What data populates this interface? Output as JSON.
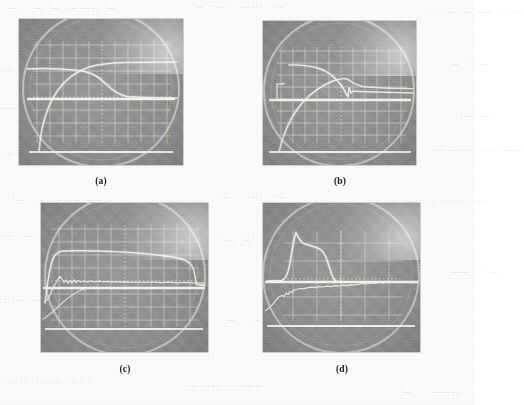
{
  "figure": {
    "kind": "scanned-photographic-figure",
    "panel_count": 4,
    "paper_color": "#fbfbfa",
    "photo_background_color": "#8d8d8d",
    "trace_color": "#f2f2ee",
    "graticule_color": "#d8d8d2"
  },
  "captions": [
    {
      "id": "a",
      "label": "(a)"
    },
    {
      "id": "b",
      "label": "(b)"
    },
    {
      "id": "c",
      "label": "(c)"
    },
    {
      "id": "d",
      "label": "(d)"
    }
  ],
  "ghost_text": [
    {
      "text": "· — ·· —   ·—· —  ——  ·—",
      "x": 2,
      "y": 4,
      "size": 7
    },
    {
      "text": "—  ··—· ·  ——·· ·—",
      "x": 196,
      "y": 3,
      "size": 7
    },
    {
      "text": "··· —  ·—  —— ·· —·",
      "x": 430,
      "y": 8,
      "size": 7
    },
    {
      "text": "·— ·—·· ·",
      "x": 0,
      "y": 66,
      "size": 7
    },
    {
      "text": "— ·· ·—",
      "x": 452,
      "y": 60,
      "size": 7
    },
    {
      "text": "—— ·· · —·—",
      "x": 0,
      "y": 104,
      "size": 7
    },
    {
      "text": "··— ·—",
      "x": 456,
      "y": 112,
      "size": 7
    },
    {
      "text": "·—· ·· ——— ·—·· ·",
      "x": 2,
      "y": 150,
      "size": 7
    },
    {
      "text": "·—  ——— ·—·· ——",
      "x": 432,
      "y": 146,
      "size": 7
    },
    {
      "text": "··—· ·—· ——— —— ·",
      "x": 8,
      "y": 196,
      "size": 7
    },
    {
      "text": "— ·· ·—·· ·—",
      "x": 222,
      "y": 193,
      "size": 7
    },
    {
      "text": "·—·· ·· ——— ·—·",
      "x": 402,
      "y": 197,
      "size": 7
    },
    {
      "text": "·—· ·—",
      "x": 0,
      "y": 232,
      "size": 7
    },
    {
      "text": "·— ·—·· ——— ··—",
      "x": 222,
      "y": 236,
      "size": 7
    },
    {
      "text": "—— ·· ·—",
      "x": 452,
      "y": 268,
      "size": 7
    },
    {
      "text": "·· ·—· ———",
      "x": 0,
      "y": 296,
      "size": 7
    },
    {
      "text": "—·· ·—·· ——",
      "x": 228,
      "y": 316,
      "size": 7
    },
    {
      "text": "·—·· ·· —— ·—· ·",
      "x": 6,
      "y": 378,
      "size": 7
    },
    {
      "text": "·— —— ·· ———",
      "x": 186,
      "y": 382,
      "size": 7
    },
    {
      "text": "·—· ·· ———",
      "x": 400,
      "y": 388,
      "size": 7
    }
  ],
  "chart_data": [
    {
      "id": "a",
      "type": "line",
      "title": "(a)",
      "display": "oscilloscope CRT photograph",
      "graticule": {
        "columns": 10,
        "rows": 8,
        "on": true,
        "center_ticks": true
      },
      "axis_note": "horizontal axis is time, vertical axis is signal amplitude; no numeric tick labels are printed on the photograph",
      "traces": [
        {
          "name": "upper-decaying-trace",
          "note": "nearly flat plateau in the left half that rolls off and drops steeply just right of screen centre",
          "x": [
            0.0,
            0.06,
            0.12,
            0.18,
            0.24,
            0.3,
            0.36,
            0.42,
            0.46,
            0.5,
            0.54,
            0.58,
            0.62,
            0.66,
            0.7,
            0.76,
            0.84,
            0.92,
            1.0
          ],
          "y": [
            0.66,
            0.665,
            0.665,
            0.66,
            0.655,
            0.645,
            0.63,
            0.61,
            0.59,
            0.565,
            0.53,
            0.49,
            0.44,
            0.4,
            0.385,
            0.38,
            0.378,
            0.377,
            0.376
          ]
        },
        {
          "name": "rising-s-curve-trace",
          "note": "starts at the bottom baseline on the left, rises with an exponential S shape and merges with the falling trace near screen centre",
          "x": [
            0.0,
            0.05,
            0.1,
            0.14,
            0.18,
            0.22,
            0.26,
            0.3,
            0.34,
            0.38,
            0.42,
            0.46,
            0.5,
            0.54,
            0.6,
            0.7,
            0.85,
            1.0
          ],
          "y": [
            0.085,
            0.087,
            0.092,
            0.105,
            0.13,
            0.165,
            0.215,
            0.275,
            0.34,
            0.41,
            0.475,
            0.53,
            0.565,
            0.58,
            0.583,
            0.583,
            0.582,
            0.582
          ]
        },
        {
          "name": "mid-baseline-trace",
          "note": "bright horizontal reference line crossing the full width at about 45 percent screen height",
          "x": [
            0.0,
            1.0
          ],
          "y": [
            0.455,
            0.455
          ]
        },
        {
          "name": "lower-baseline-trace",
          "note": "bright horizontal reference line near the bottom of the graticule",
          "x": [
            0.0,
            1.0
          ],
          "y": [
            0.085,
            0.085
          ]
        }
      ]
    },
    {
      "id": "b",
      "type": "line",
      "title": "(b)",
      "display": "oscilloscope CRT photograph",
      "graticule": {
        "columns": 10,
        "rows": 8,
        "on": true,
        "center_ticks": true
      },
      "axis_note": "horizontal axis is time, vertical axis is signal amplitude; no numeric tick labels are printed on the photograph",
      "traces": [
        {
          "name": "upper-decaying-trace",
          "note": "flat-topped trace beginning about one fifth from the left, sloping gently down and then falling sharply at screen centre into a small overshoot spike",
          "x": [
            0.17,
            0.22,
            0.28,
            0.34,
            0.4,
            0.45,
            0.5,
            0.54,
            0.57,
            0.6,
            0.62,
            0.64,
            0.67,
            0.72,
            0.8,
            0.9,
            1.0
          ],
          "y": [
            0.695,
            0.69,
            0.675,
            0.655,
            0.63,
            0.6,
            0.555,
            0.5,
            0.455,
            0.42,
            0.46,
            0.435,
            0.425,
            0.42,
            0.415,
            0.41,
            0.405
          ]
        },
        {
          "name": "rising-s-curve-trace",
          "note": "climbs from the lower baseline on the left through a steep exponential knee and meets the falling trace at screen centre",
          "x": [
            0.1,
            0.16,
            0.22,
            0.27,
            0.32,
            0.36,
            0.4,
            0.44,
            0.48,
            0.52,
            0.55,
            0.58,
            0.62,
            0.7,
            0.85,
            1.0
          ],
          "y": [
            0.085,
            0.09,
            0.1,
            0.125,
            0.165,
            0.215,
            0.275,
            0.345,
            0.42,
            0.48,
            0.5,
            0.49,
            0.475,
            0.47,
            0.465,
            0.46
          ]
        },
        {
          "name": "mid-baseline-trace",
          "note": "bright horizontal reference line across the full width at about 45 percent screen height",
          "x": [
            0.0,
            1.0
          ],
          "y": [
            0.45,
            0.45
          ]
        },
        {
          "name": "lower-baseline-trace",
          "note": "bright horizontal reference line near the bottom of the graticule",
          "x": [
            0.0,
            1.0
          ],
          "y": [
            0.085,
            0.085
          ]
        },
        {
          "name": "left-step-trace",
          "note": "short vertical step at the far left joining the mid baseline to a brief flat segment above it",
          "x": [
            0.02,
            0.06,
            0.08,
            0.08,
            0.12
          ],
          "y": [
            0.45,
            0.45,
            0.45,
            0.56,
            0.56
          ]
        }
      ]
    },
    {
      "id": "c",
      "type": "line",
      "title": "(c)",
      "display": "oscilloscope CRT photograph",
      "graticule": {
        "columns": 10,
        "rows": 8,
        "on": true,
        "center_ticks": true
      },
      "axis_note": "horizontal axis is time, vertical axis is signal amplitude; no numeric tick labels are printed on the photograph",
      "traces": [
        {
          "name": "upper-plateau-trace",
          "note": "rises very steeply at the left edge to a long flat plateau that sags slowly across the screen and then drops sharply near the right edge",
          "x": [
            0.02,
            0.04,
            0.06,
            0.08,
            0.12,
            0.2,
            0.3,
            0.4,
            0.5,
            0.58,
            0.66,
            0.74,
            0.8,
            0.85,
            0.88,
            0.9,
            0.92,
            0.96,
            1.0
          ],
          "y": [
            0.33,
            0.44,
            0.56,
            0.655,
            0.675,
            0.672,
            0.665,
            0.655,
            0.645,
            0.635,
            0.62,
            0.6,
            0.585,
            0.565,
            0.54,
            0.49,
            0.44,
            0.43,
            0.428
          ]
        },
        {
          "name": "noisy-middle-trace",
          "note": "noisy ripple riding just above the mid reference line, with a pronounced dip and recovery in the left third",
          "x": [
            0.02,
            0.06,
            0.1,
            0.13,
            0.16,
            0.19,
            0.22,
            0.25,
            0.28,
            0.32,
            0.38,
            0.45,
            0.52,
            0.6,
            0.68,
            0.76,
            0.84,
            0.9,
            0.95,
            1.0
          ],
          "y": [
            0.34,
            0.355,
            0.4,
            0.43,
            0.4,
            0.435,
            0.415,
            0.445,
            0.455,
            0.46,
            0.465,
            0.468,
            0.47,
            0.468,
            0.465,
            0.462,
            0.458,
            0.452,
            0.45,
            0.448
          ]
        },
        {
          "name": "mid-baseline-trace",
          "note": "bright horizontal reference line across the full width at roughly 43 percent screen height",
          "x": [
            0.0,
            1.0
          ],
          "y": [
            0.432,
            0.432
          ]
        },
        {
          "name": "lower-rising-trace",
          "note": "faint ramp rising from the bottom left of the graticule up toward the noisy middle trace",
          "x": [
            0.0,
            0.04,
            0.08,
            0.12,
            0.16,
            0.2,
            0.24,
            0.28,
            0.32
          ],
          "y": [
            0.145,
            0.17,
            0.215,
            0.275,
            0.315,
            0.355,
            0.385,
            0.41,
            0.43
          ]
        },
        {
          "name": "lower-baseline-trace",
          "note": "bright horizontal reference line near the bottom of the graticule",
          "x": [
            0.0,
            1.0
          ],
          "y": [
            0.155,
            0.155
          ]
        }
      ]
    },
    {
      "id": "d",
      "type": "line",
      "title": "(d)",
      "display": "oscilloscope CRT photograph",
      "graticule": {
        "columns": 10,
        "rows": 8,
        "on": true,
        "center_ticks": true
      },
      "axis_note": "horizontal axis is time, vertical axis is signal amplitude; no numeric tick labels are printed on the photograph",
      "traces": [
        {
          "name": "pulse-trace",
          "note": "narrow pulse in the left third: near-vertical leading edge to a sharp peak, a slightly drooping top, then a steep fall back to the baseline before screen centre",
          "x": [
            0.02,
            0.08,
            0.13,
            0.17,
            0.19,
            0.2,
            0.22,
            0.25,
            0.29,
            0.33,
            0.37,
            0.4,
            0.42,
            0.44,
            0.45,
            0.46,
            0.48,
            0.52,
            0.6,
            0.8,
            1.0
          ],
          "y": [
            0.475,
            0.478,
            0.5,
            0.6,
            0.72,
            0.8,
            0.775,
            0.755,
            0.74,
            0.725,
            0.7,
            0.665,
            0.61,
            0.545,
            0.51,
            0.49,
            0.482,
            0.48,
            0.478,
            0.477,
            0.476
          ]
        },
        {
          "name": "noisy-rising-trace",
          "note": "noisy trace climbing from the lower left, flattening after the first third and continuing as a rippled line just above the baseline to the right edge",
          "x": [
            0.0,
            0.05,
            0.09,
            0.12,
            0.15,
            0.18,
            0.21,
            0.24,
            0.28,
            0.33,
            0.4,
            0.45,
            0.48,
            0.52,
            0.57,
            0.62,
            0.68,
            0.72,
            0.76,
            0.8,
            0.85,
            0.9,
            0.95,
            1.0
          ],
          "y": [
            0.195,
            0.245,
            0.3,
            0.345,
            0.355,
            0.4,
            0.41,
            0.425,
            0.44,
            0.45,
            0.462,
            0.47,
            0.465,
            0.475,
            0.47,
            0.478,
            0.49,
            0.505,
            0.5,
            0.512,
            0.505,
            0.515,
            0.505,
            0.5
          ]
        },
        {
          "name": "mid-baseline-trace",
          "note": "bright horizontal reference line across the full width at about 47 percent screen height",
          "x": [
            0.0,
            1.0
          ],
          "y": [
            0.468,
            0.468
          ]
        },
        {
          "name": "lower-baseline-trace",
          "note": "bright horizontal reference line near the bottom of the graticule",
          "x": [
            0.0,
            1.0
          ],
          "y": [
            0.175,
            0.175
          ]
        }
      ]
    }
  ]
}
